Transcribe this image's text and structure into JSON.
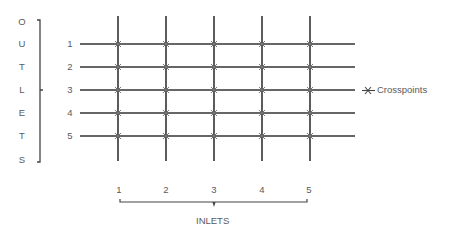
{
  "diagram": {
    "type": "crossbar-switch",
    "outlets_label_letters": [
      "O",
      "U",
      "T",
      "L",
      "E",
      "T",
      "S"
    ],
    "outlet_numbers": [
      "1",
      "2",
      "3",
      "4",
      "5"
    ],
    "inlet_numbers": [
      "1",
      "2",
      "3",
      "4",
      "5"
    ],
    "inlets_label": "INLETS",
    "legend": {
      "symbol": "x-mark",
      "label": "Crosspoints"
    },
    "line_color": "#333333",
    "text_color": "#5a5a5a"
  }
}
